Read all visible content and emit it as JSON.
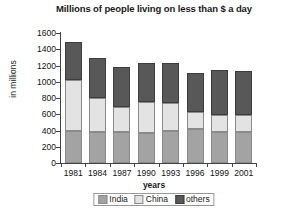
{
  "chart_data": {
    "type": "bar",
    "stacked": true,
    "title": "Millions of people living on less than $ a day",
    "xlabel": "years",
    "ylabel": "in millions",
    "categories": [
      "1981",
      "1984",
      "1987",
      "1990",
      "1993",
      "1996",
      "1999",
      "2001"
    ],
    "series": [
      {
        "name": "India",
        "color": "#a3a3a3",
        "values": [
          390,
          385,
          380,
          375,
          400,
          420,
          380,
          385
        ]
      },
      {
        "name": "China",
        "color": "#e3e3e3",
        "values": [
          630,
          420,
          310,
          370,
          335,
          205,
          215,
          205
        ]
      },
      {
        "name": "others",
        "color": "#585858",
        "values": [
          475,
          485,
          490,
          490,
          490,
          485,
          550,
          540
        ]
      }
    ],
    "totals": [
      1495,
      1290,
      1180,
      1235,
      1225,
      1110,
      1145,
      1130
    ],
    "ylim": [
      0,
      1600
    ],
    "ytick_step": 200,
    "yticks": [
      "1600",
      "1400",
      "1200",
      "1000",
      "800",
      "600",
      "400",
      "200",
      "0"
    ],
    "grid": false,
    "legend_position": "bottom"
  }
}
